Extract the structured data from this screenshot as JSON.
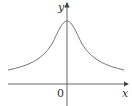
{
  "graph": {
    "x_label": "x",
    "y_label": "y",
    "origin_label": "0",
    "curve": "bell-shaped curve symmetric about the y-axis, maximum at x=0, approaching a horizontal asymptote above the x-axis",
    "colors": {
      "axis": "#555555",
      "curve": "#777777",
      "text": "#333333"
    }
  }
}
